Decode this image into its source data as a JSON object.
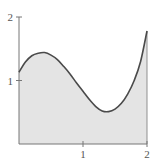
{
  "chart_data": {
    "type": "area",
    "title": "",
    "xlabel": "",
    "ylabel": "",
    "xlim": [
      0,
      2
    ],
    "ylim": [
      0,
      2
    ],
    "x_ticks": [
      {
        "value": 1,
        "label": "1"
      },
      {
        "value": 2,
        "label": "2"
      }
    ],
    "y_ticks": [
      {
        "value": 1,
        "label": "1"
      },
      {
        "value": 2,
        "label": "2"
      }
    ],
    "grid": false,
    "legend": null,
    "series": [
      {
        "name": "f(x)",
        "x": [
          0,
          0.1,
          0.2,
          0.3,
          0.4,
          0.5,
          0.6,
          0.7,
          0.8,
          0.9,
          1.0,
          1.1,
          1.2,
          1.3,
          1.4,
          1.5,
          1.6,
          1.7,
          1.8,
          1.9,
          2.0
        ],
        "values": [
          1.13,
          1.29,
          1.39,
          1.43,
          1.44,
          1.4,
          1.33,
          1.22,
          1.1,
          0.96,
          0.83,
          0.7,
          0.59,
          0.52,
          0.51,
          0.55,
          0.64,
          0.79,
          1.0,
          1.3,
          1.78
        ]
      }
    ]
  },
  "colors": {
    "fill": "#e4e4e4",
    "curve": "#4a4a4a",
    "axis": "#777777",
    "label": "#555555"
  }
}
